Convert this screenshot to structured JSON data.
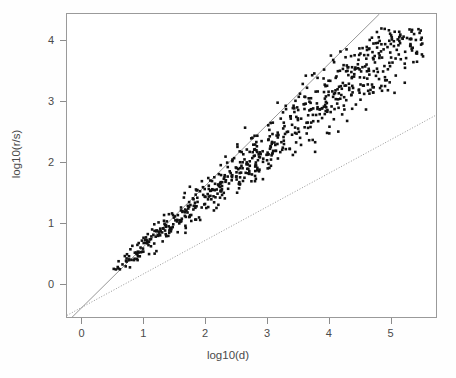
{
  "chart_data": {
    "type": "scatter",
    "title": "",
    "xlabel": "log10(d)",
    "ylabel": "log10(r/s)",
    "xlim": [
      -0.25,
      5.75
    ],
    "ylim": [
      -0.55,
      4.45
    ],
    "xticks": [
      0,
      1,
      2,
      3,
      4,
      5
    ],
    "yticks": [
      0,
      1,
      2,
      3,
      4
    ],
    "xtick_labels": [
      "0",
      "1",
      "2",
      "3",
      "4",
      "5"
    ],
    "ytick_labels": [
      "0",
      "1",
      "2",
      "3",
      "4"
    ],
    "grid": false,
    "legend": null,
    "marker": "filled-square",
    "marker_color": "#111111",
    "marker_size_px": 2.6,
    "frame_color": "#9a9a9a",
    "background": "#ffffff",
    "n_points": 760,
    "band": {
      "description": "Dense elongated scatter band rising from lower-left to upper-right, roughly linear in log-log space with slope near 0.82 and visible vertical spread that widens with x.",
      "x_range": [
        0.45,
        5.55
      ],
      "y_range": [
        0.17,
        4.22
      ],
      "slope": 0.82,
      "intercept": -0.2,
      "spread_base": 0.1,
      "spread_growth": 0.085
    },
    "reference_lines": [
      {
        "name": "upper-solid-line",
        "style": "solid",
        "color": "#8a8a8a",
        "slope": 1.0,
        "intercept": -0.38,
        "x_start": -0.25,
        "x_end": 4.85
      },
      {
        "name": "lower-dotted-line",
        "style": "dotted",
        "color": "#8a8a8a",
        "slope": 0.55,
        "intercept": -0.38,
        "x_start": -0.25,
        "x_end": 5.75
      }
    ]
  }
}
